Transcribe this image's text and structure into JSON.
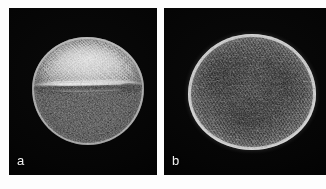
{
  "figure": {
    "background_color": "#ffffff",
    "panel_background_color": "#040404",
    "label_color": "#f0f0f0",
    "panels": [
      {
        "id": "a",
        "label": "a",
        "view": "equatorial view",
        "subject": "pollen grain",
        "features": "single longitudinal colpus (furrow) running horizontally across the grain equator; granular / scabrate exine surface",
        "imaging": "scanning electron micrograph",
        "grain_outline": "broadly oval, slightly flattened",
        "aperture_label": "colpus"
      },
      {
        "id": "b",
        "label": "b",
        "view": "polar view",
        "subject": "pollen grain",
        "features": "rounded-triangular outline with three shallow lobes; rugulate / striate-rugulate exine sculpture, bright raised rim",
        "imaging": "scanning electron micrograph",
        "grain_outline": "sub-circular to obtusely triangular",
        "aperture_label": ""
      }
    ]
  }
}
